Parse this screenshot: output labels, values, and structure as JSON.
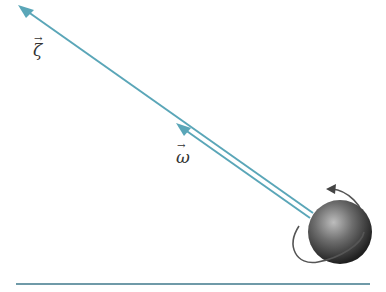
{
  "diagram": {
    "vectors": [
      {
        "id": "zeta",
        "symbol": "ζ",
        "arrow": "→",
        "label_pos": [
          32,
          40
        ]
      },
      {
        "id": "omega",
        "symbol": "ω",
        "arrow": "→",
        "label_pos": [
          176,
          152
        ]
      }
    ],
    "colors": {
      "vector_line": "#5aa6b8",
      "sphere_dark": "#2b2b2b",
      "sphere_light": "#a8a8a8",
      "rotation_arrow": "#555555",
      "ground_line": "#6f9aa8"
    },
    "elements": [
      "rotation-direction-arrow",
      "spinning-sphere",
      "ground-line"
    ]
  }
}
